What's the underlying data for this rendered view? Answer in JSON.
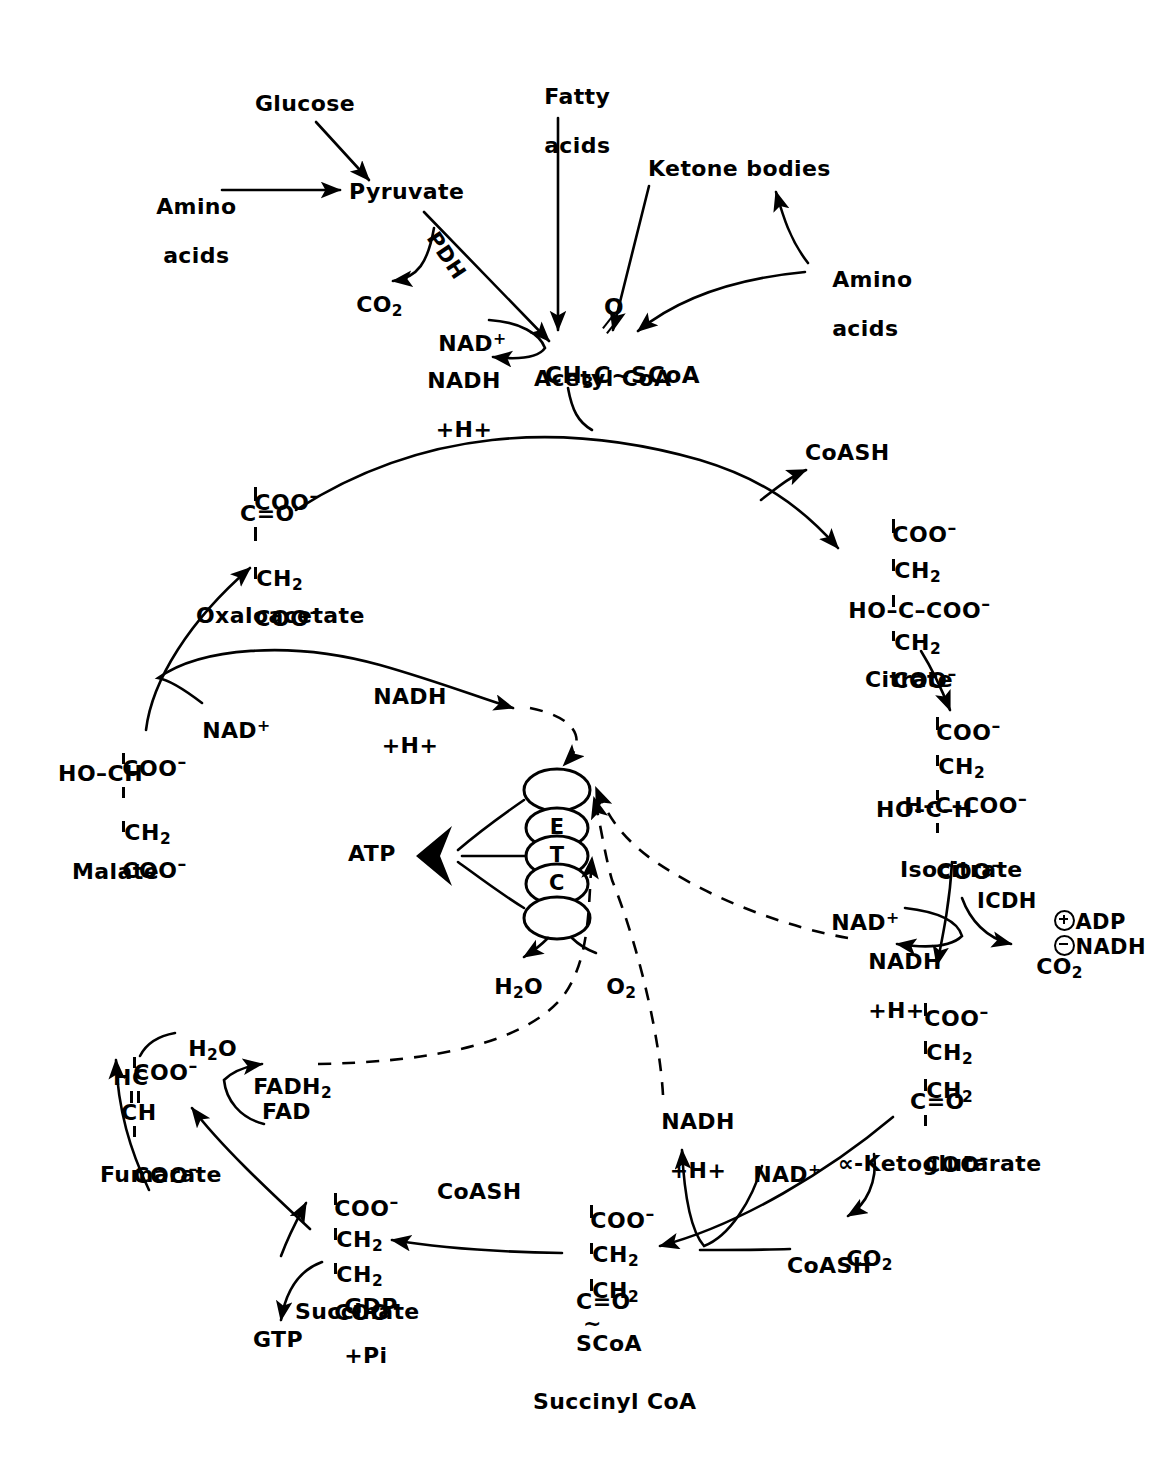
{
  "diagram": {
    "type": "metabolic-pathway",
    "ink_color": "#000000",
    "background": "#ffffff"
  },
  "inputs": {
    "glucose": "Glucose",
    "amino_acids_left": "Amino\nacids",
    "fatty_acids": "Fatty\nacids",
    "ketone_bodies": "Ketone bodies",
    "amino_acids_right": "Amino\nacids"
  },
  "pyruvate": {
    "name": "Pyruvate",
    "enzyme": "PDH",
    "co2": "CO",
    "co2_sub": "2",
    "nad": "NAD",
    "nad_sup": "+",
    "nadh": "NADH",
    "nadh_h": "+H+"
  },
  "acetyl_coa": {
    "formula_a": "CH",
    "formula_a_sub": "3",
    "formula_b": "C",
    "formula_c": "~SCoA",
    "carbonyl_o": "O",
    "name": "Acetyl CoA"
  },
  "oxaloacetate": {
    "name": "Oxaloacetate",
    "lines": [
      "COO",
      "C=O",
      "CH",
      "COO"
    ],
    "l1_minus": "–",
    "l3_sub": "2",
    "l4_minus": "–",
    "nad": "NAD",
    "nad_sup": "+",
    "nadh": "NADH",
    "nadh_h": "+H+"
  },
  "citrate": {
    "name": "Citrate",
    "coash": "CoASH",
    "l1": "COO",
    "l1_minus": "–",
    "l2": "CH",
    "l2_sub": "2",
    "l3": "HO–C–COO",
    "l3_minus": "–",
    "l4": "CH",
    "l4_sub": "2",
    "l5": "COO",
    "l5_minus": "–"
  },
  "isocitrate": {
    "name": "Isocitrate",
    "l1": "COO",
    "l1_minus": "–",
    "l2": "CH",
    "l2_sub": "2",
    "l3": "H–C–COO",
    "l3_minus": "–",
    "l4": "HO–C–H",
    "l5": "COO",
    "l5_minus": "–",
    "nad": "NAD",
    "nad_sup": "+",
    "enzyme": "ICDH",
    "activator": "ADP",
    "inhibitor": "NADH",
    "nadh": "NADH",
    "nadh_h": "+H+",
    "co2": "CO",
    "co2_sub": "2"
  },
  "ketoglutarate": {
    "name": "∝-Ketoglutarate",
    "l1": "COO",
    "l1_minus": "–",
    "l2": "CH",
    "l2_sub": "2",
    "l3": "CH",
    "l3_sub": "2",
    "l4": "C=O",
    "l5": "COO",
    "l5_minus": "–",
    "nad": "NAD",
    "nad_sup": "+",
    "nadh": "NADH",
    "nadh_h": "+H+",
    "co2": "CO",
    "co2_sub": "2",
    "coash": "CoASH"
  },
  "succinyl_coa": {
    "name": "Succinyl CoA",
    "l1": "COO",
    "l1_minus": "–",
    "l2": "CH",
    "l2_sub": "2",
    "l3": "CH",
    "l3_sub": "2",
    "l4": "C=O",
    "l5": "SCoA",
    "coash": "CoASH",
    "gdp": "GDP",
    "pi": "+Pi",
    "gtp": "GTP"
  },
  "succinate": {
    "name": "Succinate",
    "l1": "COO",
    "l1_minus": "–",
    "l2": "CH",
    "l2_sub": "2",
    "l3": "CH",
    "l3_sub": "2",
    "l4": "COO",
    "l4_minus": "–",
    "fad": "FAD",
    "fadh2": "FADH",
    "fadh2_sub": "2"
  },
  "fumarate": {
    "name": "Fumarate",
    "l1": "COO",
    "l1_minus": "–",
    "l2": "HC",
    "l3": "CH",
    "l4": "COO",
    "l4_minus": "–",
    "h2o": "H",
    "h2o_sub": "2",
    "h2o_end": "O"
  },
  "malate": {
    "name": "Malate",
    "l1": "COO",
    "l1_minus": "–",
    "l2": "HO–CH",
    "l3": "CH",
    "l3_sub": "2",
    "l4": "COO",
    "l4_minus": "–"
  },
  "etc": {
    "letters": [
      "E",
      "T",
      "C"
    ],
    "atp": "ATP",
    "water": "H",
    "water_sub": "2",
    "water_end": "O",
    "oxygen": "O",
    "oxygen_sub": "2"
  }
}
